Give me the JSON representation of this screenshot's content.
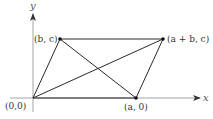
{
  "diagram": {
    "type": "parallelogram-with-diagonals",
    "axes": {
      "x_label": "x",
      "y_label": "y",
      "color": "#9a9a9a"
    },
    "points": {
      "origin": {
        "label": "(0,0)",
        "px": [
          33,
          98
        ]
      },
      "a0": {
        "label": "(a, 0)",
        "px": [
          136,
          98
        ]
      },
      "bc": {
        "label": "(b, c)",
        "px": [
          60,
          39
        ]
      },
      "abc": {
        "label": "(a + b, c)",
        "px": [
          163,
          39
        ]
      }
    },
    "edges": [
      [
        "origin",
        "a0"
      ],
      [
        "a0",
        "abc"
      ],
      [
        "abc",
        "bc"
      ],
      [
        "bc",
        "origin"
      ]
    ],
    "diagonals": [
      [
        "origin",
        "abc"
      ],
      [
        "bc",
        "a0"
      ]
    ],
    "line_color": "#2a2a2a",
    "point_color": "#111111"
  }
}
